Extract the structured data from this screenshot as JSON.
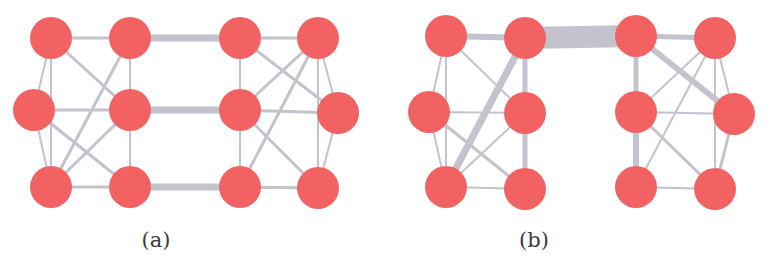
{
  "figure": {
    "colors": {
      "node": "#f26262",
      "edge": "#c2c3cc",
      "background": "#ffffff",
      "caption": "#3a3a3a"
    },
    "node_radius": 21,
    "panels": [
      {
        "id": "a",
        "caption": "(a)",
        "caption_x": 156,
        "nodes": [
          {
            "id": "a1",
            "x": 51,
            "y": 38
          },
          {
            "id": "a2",
            "x": 130,
            "y": 38
          },
          {
            "id": "a3",
            "x": 240,
            "y": 38
          },
          {
            "id": "a4",
            "x": 318,
            "y": 38
          },
          {
            "id": "b1",
            "x": 34,
            "y": 110
          },
          {
            "id": "b2",
            "x": 130,
            "y": 110
          },
          {
            "id": "b3",
            "x": 240,
            "y": 110
          },
          {
            "id": "b4",
            "x": 338,
            "y": 113
          },
          {
            "id": "c1",
            "x": 51,
            "y": 187
          },
          {
            "id": "c2",
            "x": 130,
            "y": 187
          },
          {
            "id": "c3",
            "x": 240,
            "y": 187
          },
          {
            "id": "c4",
            "x": 318,
            "y": 188
          }
        ],
        "edges": [
          {
            "from": "a2",
            "to": "a3",
            "w": 7
          },
          {
            "from": "b2",
            "to": "b3",
            "w": 7
          },
          {
            "from": "c2",
            "to": "c3",
            "w": 7
          },
          {
            "from": "a1",
            "to": "a2",
            "w": 3
          },
          {
            "from": "a1",
            "to": "b1",
            "w": 2
          },
          {
            "from": "a1",
            "to": "c1",
            "w": 2
          },
          {
            "from": "a1",
            "to": "b2",
            "w": 3
          },
          {
            "from": "a2",
            "to": "b2",
            "w": 2
          },
          {
            "from": "a2",
            "to": "c1",
            "w": 3
          },
          {
            "from": "b1",
            "to": "b2",
            "w": 3
          },
          {
            "from": "b1",
            "to": "c1",
            "w": 2
          },
          {
            "from": "b1",
            "to": "c2",
            "w": 3
          },
          {
            "from": "b2",
            "to": "c1",
            "w": 3
          },
          {
            "from": "b2",
            "to": "c2",
            "w": 2
          },
          {
            "from": "c1",
            "to": "c2",
            "w": 3
          },
          {
            "from": "a3",
            "to": "a4",
            "w": 3
          },
          {
            "from": "a3",
            "to": "b3",
            "w": 2
          },
          {
            "from": "a3",
            "to": "b4",
            "w": 3
          },
          {
            "from": "a4",
            "to": "b3",
            "w": 3
          },
          {
            "from": "a4",
            "to": "c3",
            "w": 3
          },
          {
            "from": "a4",
            "to": "b4",
            "w": 2
          },
          {
            "from": "a4",
            "to": "c4",
            "w": 2
          },
          {
            "from": "b3",
            "to": "b4",
            "w": 3
          },
          {
            "from": "b3",
            "to": "c3",
            "w": 2
          },
          {
            "from": "b3",
            "to": "c4",
            "w": 3
          },
          {
            "from": "b4",
            "to": "c4",
            "w": 2
          },
          {
            "from": "c3",
            "to": "c4",
            "w": 3
          }
        ]
      },
      {
        "id": "b",
        "caption": "(b)",
        "caption_x": 534,
        "nodes": [
          {
            "id": "a1",
            "x": 446,
            "y": 36
          },
          {
            "id": "a2",
            "x": 525,
            "y": 38
          },
          {
            "id": "a3",
            "x": 636,
            "y": 36
          },
          {
            "id": "a4",
            "x": 715,
            "y": 38
          },
          {
            "id": "b1",
            "x": 429,
            "y": 112
          },
          {
            "id": "b2",
            "x": 525,
            "y": 113
          },
          {
            "id": "b3",
            "x": 636,
            "y": 112
          },
          {
            "id": "b4",
            "x": 734,
            "y": 114
          },
          {
            "id": "c1",
            "x": 446,
            "y": 187
          },
          {
            "id": "c2",
            "x": 525,
            "y": 189
          },
          {
            "id": "c3",
            "x": 636,
            "y": 187
          },
          {
            "id": "c4",
            "x": 715,
            "y": 189
          }
        ],
        "edges": [
          {
            "from": "a2",
            "to": "a3",
            "w": 22
          },
          {
            "from": "a1",
            "to": "a2",
            "w": 6
          },
          {
            "from": "a1",
            "to": "b1",
            "w": 2
          },
          {
            "from": "a1",
            "to": "c1",
            "w": 2
          },
          {
            "from": "a1",
            "to": "b2",
            "w": 2
          },
          {
            "from": "a2",
            "to": "b2",
            "w": 5
          },
          {
            "from": "a2",
            "to": "c1",
            "w": 7
          },
          {
            "from": "b1",
            "to": "b2",
            "w": 2
          },
          {
            "from": "b1",
            "to": "c1",
            "w": 2
          },
          {
            "from": "b1",
            "to": "c2",
            "w": 3
          },
          {
            "from": "b2",
            "to": "c1",
            "w": 2
          },
          {
            "from": "b2",
            "to": "c2",
            "w": 5
          },
          {
            "from": "c1",
            "to": "c2",
            "w": 2
          },
          {
            "from": "a3",
            "to": "a4",
            "w": 5
          },
          {
            "from": "a3",
            "to": "b3",
            "w": 5
          },
          {
            "from": "a3",
            "to": "b4",
            "w": 6
          },
          {
            "from": "a4",
            "to": "b3",
            "w": 2
          },
          {
            "from": "a4",
            "to": "c3",
            "w": 2
          },
          {
            "from": "a4",
            "to": "b4",
            "w": 2
          },
          {
            "from": "a4",
            "to": "c4",
            "w": 2
          },
          {
            "from": "b3",
            "to": "b4",
            "w": 2
          },
          {
            "from": "b3",
            "to": "c3",
            "w": 6
          },
          {
            "from": "b3",
            "to": "c4",
            "w": 3
          },
          {
            "from": "b4",
            "to": "c4",
            "w": 3
          },
          {
            "from": "c3",
            "to": "c4",
            "w": 2
          }
        ]
      }
    ]
  }
}
